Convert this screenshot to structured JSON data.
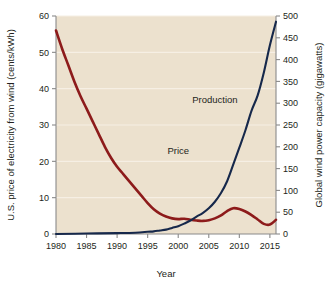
{
  "chart_data": {
    "type": "line",
    "title": "",
    "xlabel": "Year",
    "ylabel": "U.S. price of electricity from wind (cents/kWh)",
    "y2label": "Global wind power capacity (gigawatts)",
    "xlim": [
      1980,
      2016
    ],
    "ylim": [
      0,
      60
    ],
    "y2lim": [
      0,
      500
    ],
    "xticks": [
      1980,
      1985,
      1990,
      1995,
      2000,
      2005,
      2010,
      2015
    ],
    "yticks": [
      0,
      10,
      20,
      30,
      40,
      50,
      60
    ],
    "y2ticks": [
      0,
      50,
      100,
      150,
      200,
      250,
      300,
      350,
      400,
      450,
      500
    ],
    "grid": true,
    "legend_position": "inline-annotations",
    "background_color": "#ece1ce",
    "series": [
      {
        "name": "Price",
        "axis": "left",
        "units": "cents/kWh",
        "color": "#8d1b1b",
        "label_x": 2000,
        "label_y": 22,
        "x": [
          1980,
          1981,
          1982,
          1983,
          1984,
          1985,
          1986,
          1987,
          1988,
          1989,
          1990,
          1991,
          1992,
          1993,
          1994,
          1995,
          1996,
          1997,
          1998,
          1999,
          2000,
          2001,
          2002,
          2003,
          2004,
          2005,
          2006,
          2007,
          2008,
          2009,
          2010,
          2011,
          2012,
          2013,
          2014,
          2015,
          2016
        ],
        "values": [
          56,
          51,
          46.5,
          42,
          38,
          34.5,
          31,
          27.5,
          24,
          21,
          18.5,
          16.5,
          14.5,
          12.5,
          10.5,
          8.5,
          6.8,
          5.6,
          4.8,
          4.3,
          4.1,
          4.2,
          3.9,
          3.7,
          3.6,
          3.8,
          4.3,
          5.1,
          6.3,
          7.1,
          6.9,
          6.2,
          5.2,
          4.0,
          2.8,
          2.6,
          3.9
        ]
      },
      {
        "name": "Production",
        "axis": "right",
        "units": "gigawatts",
        "color": "#16284b",
        "label_x": 2006,
        "label_y": 300,
        "x": [
          1980,
          1985,
          1990,
          1993,
          1995,
          1996,
          1997,
          1998,
          1999,
          2000,
          2001,
          2002,
          2003,
          2004,
          2005,
          2006,
          2007,
          2008,
          2009,
          2010,
          2011,
          2012,
          2013,
          2014,
          2015,
          2016
        ],
        "values": [
          0,
          1,
          2,
          3,
          5,
          6,
          8,
          10,
          14,
          18,
          24,
          31,
          40,
          48,
          59,
          74,
          94,
          121,
          159,
          198,
          238,
          283,
          318,
          370,
          433,
          487
        ]
      }
    ],
    "annotations": [
      {
        "text": "Price",
        "series": "Price"
      },
      {
        "text": "Production",
        "series": "Production"
      }
    ]
  },
  "colors": {
    "price_line": "#8d1b1b",
    "production_line": "#16284b",
    "plot_background": "#ece1ce",
    "axis": "#8a8a8a",
    "text": "#231f20",
    "gridline": "#f6efe4"
  }
}
